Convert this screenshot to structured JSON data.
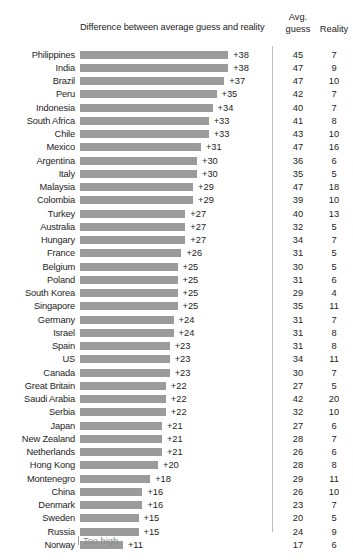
{
  "header": {
    "diff_title": "Difference between average guess and reality",
    "avg_line1": "Avg.",
    "avg_line2": "guess",
    "reality": "Reality"
  },
  "footer": {
    "too_high": "Too high"
  },
  "chart_data": {
    "type": "bar",
    "title": "Difference between average guess and reality",
    "xlabel": "",
    "ylabel": "",
    "orientation": "horizontal",
    "grid": false,
    "legend": null,
    "axis_note": "Too high",
    "xlim": [
      0,
      38
    ],
    "px_per_unit": 3.9,
    "categories": [
      "Philippines",
      "India",
      "Brazil",
      "Peru",
      "Indonesia",
      "South Africa",
      "Chile",
      "Mexico",
      "Argentina",
      "Italy",
      "Malaysia",
      "Colombia",
      "Turkey",
      "Australia",
      "Hungary",
      "France",
      "Belgium",
      "Poland",
      "South Korea",
      "Singapore",
      "Germany",
      "Israel",
      "Spain",
      "US",
      "Canada",
      "Great Britain",
      "Saudi Arabia",
      "Serbia",
      "Japan",
      "New Zealand",
      "Netherlands",
      "Hong Kong",
      "Montenegro",
      "China",
      "Denmark",
      "Sweden",
      "Russia",
      "Norway"
    ],
    "series": [
      {
        "name": "Difference between average guess and reality",
        "values": [
          38,
          38,
          37,
          35,
          34,
          33,
          33,
          31,
          30,
          30,
          29,
          29,
          27,
          27,
          27,
          26,
          25,
          25,
          25,
          25,
          24,
          24,
          23,
          23,
          23,
          22,
          22,
          22,
          21,
          21,
          21,
          20,
          18,
          16,
          16,
          15,
          15,
          11
        ]
      },
      {
        "name": "Avg. guess",
        "values": [
          45,
          47,
          47,
          42,
          40,
          41,
          43,
          47,
          36,
          35,
          47,
          39,
          40,
          32,
          34,
          31,
          30,
          31,
          29,
          35,
          31,
          31,
          31,
          34,
          30,
          27,
          42,
          32,
          27,
          28,
          26,
          28,
          29,
          26,
          23,
          20,
          24,
          17
        ]
      },
      {
        "name": "Reality",
        "values": [
          7,
          9,
          10,
          7,
          7,
          8,
          10,
          16,
          6,
          5,
          18,
          10,
          13,
          5,
          7,
          5,
          5,
          6,
          4,
          11,
          7,
          8,
          8,
          11,
          7,
          5,
          20,
          10,
          6,
          7,
          6,
          8,
          11,
          10,
          7,
          5,
          9,
          6
        ]
      }
    ],
    "value_labels": [
      "+38",
      "+38",
      "+37",
      "+35",
      "+34",
      "+33",
      "+33",
      "+31",
      "+30",
      "+30",
      "+29",
      "+29",
      "+27",
      "+27",
      "+27",
      "+26",
      "+25",
      "+25",
      "+25",
      "+25",
      "+24",
      "+24",
      "+23",
      "+23",
      "+23",
      "+22",
      "+22",
      "+22",
      "+21",
      "+21",
      "+21",
      "+20",
      "+18",
      "+16",
      "+16",
      "+15",
      "+15",
      "+11"
    ],
    "colors": {
      "bar": "#9b9b9b",
      "text": "#1d1d1d",
      "divider": "#bdbdbd",
      "note": "#8c8c8c",
      "background": "#ffffff"
    }
  }
}
